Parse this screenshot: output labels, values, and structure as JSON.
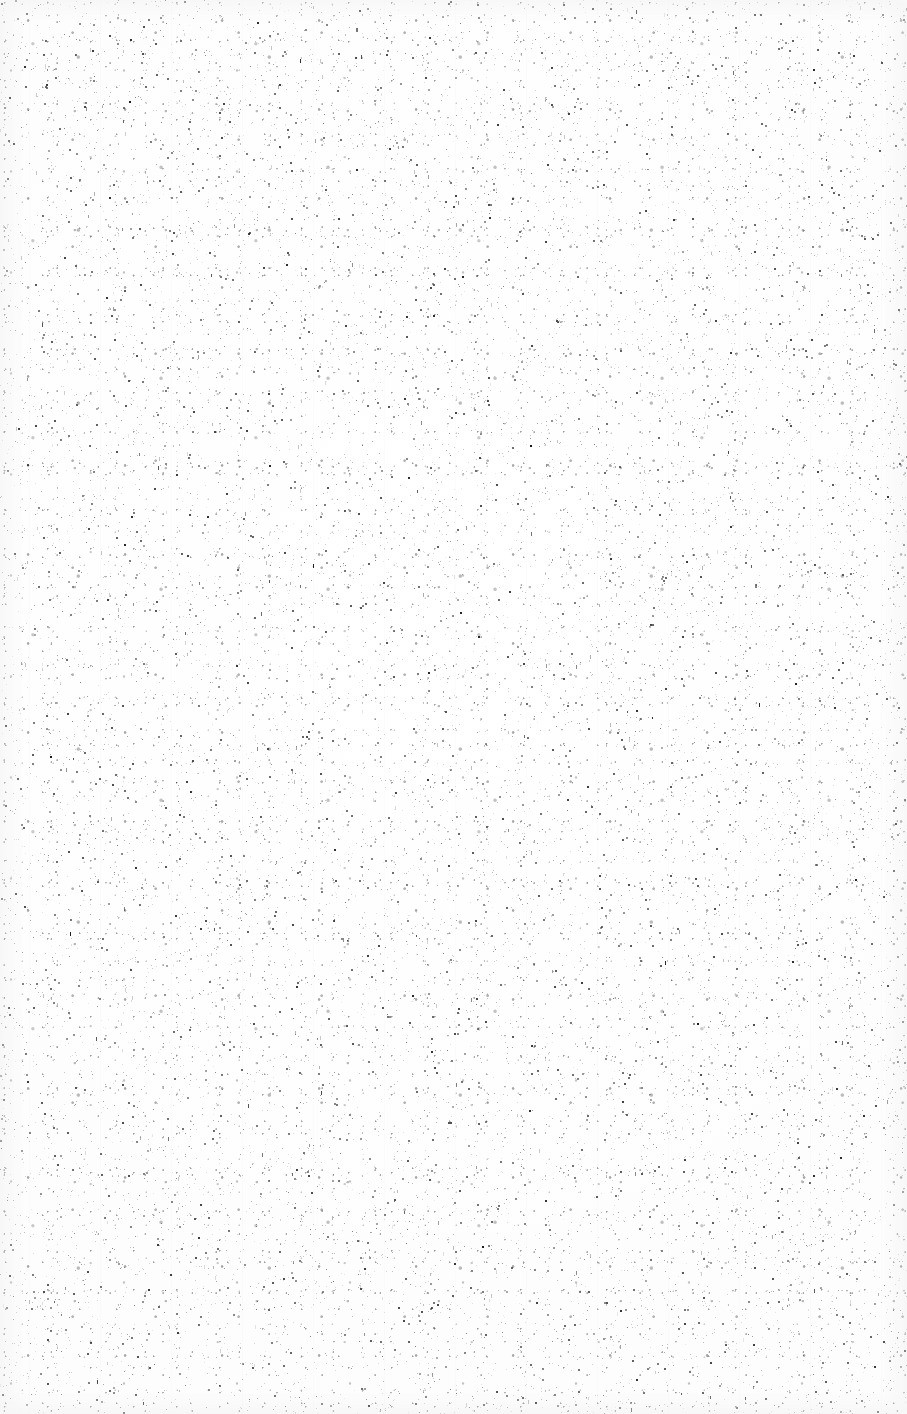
{
  "document": {
    "type": "scanned-page",
    "description": "blank page",
    "page_width_px": 907,
    "page_height_px": 1414,
    "orientation": "portrait",
    "background_color": "#fefefe",
    "speck_color": "#2a2a2e",
    "is_blank": true,
    "text_content": "",
    "header": "",
    "footer": "",
    "page_number": "",
    "title": "",
    "body_lines": [],
    "artifacts": {
      "label": "scanner speckle / paper grain",
      "kind": "random dark specks",
      "density": "sparse",
      "speck_size_px": "1-2",
      "visible_text": "none"
    }
  }
}
